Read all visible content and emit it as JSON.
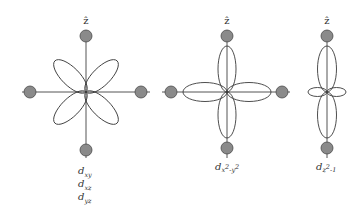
{
  "diagram": {
    "axis_label": "ẑ",
    "colors": {
      "ligand_fill": "#8a8a8a",
      "ligand_stroke": "#4a4a4a",
      "line": "#3a3a3a"
    },
    "panels": [
      {
        "id": "dxy-dxz-dyz",
        "orbital_labels": [
          {
            "base": "d",
            "sub": "xy"
          },
          {
            "base": "d",
            "sub": "xz"
          },
          {
            "base": "d",
            "sub": "yz"
          }
        ],
        "lobe_orientation": "diagonal",
        "ligands": 4
      },
      {
        "id": "dx2-y2",
        "orbital_labels": [
          {
            "base": "d",
            "sub": "x",
            "sup1": "2",
            "sub2": "-y",
            "sup2": "2"
          }
        ],
        "lobe_orientation": "on-axis",
        "ligands": 4
      },
      {
        "id": "dz2",
        "orbital_labels": [
          {
            "base": "d",
            "sub": "z",
            "sup1": "2",
            "sub2": "-1"
          }
        ],
        "lobe_orientation": "z-axis with torus",
        "ligands": 2
      }
    ]
  }
}
